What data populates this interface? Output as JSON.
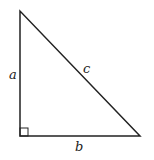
{
  "diagram": {
    "type": "right-triangle",
    "labels": {
      "vertical_side": "a",
      "horizontal_side": "b",
      "hypotenuse": "c"
    },
    "right_angle_marker": true,
    "stroke_color": "#222222"
  }
}
